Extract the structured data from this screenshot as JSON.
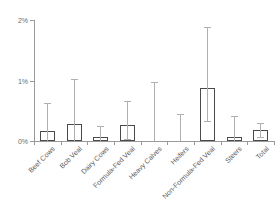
{
  "chart_data": {
    "type": "bar",
    "title": "",
    "subtitle": "",
    "xlabel": "",
    "ylabel": "",
    "ylim": [
      0,
      2
    ],
    "yunit": "%",
    "grid": false,
    "legend": false,
    "error_bars": true,
    "categories": [
      "Beef Cows",
      "Bob Veal",
      "Dairy Cows",
      "Formula-Fed Veal",
      "Heavy Calves",
      "Heifers",
      "Non-Formula-Fed Veal",
      "Steers",
      "Total"
    ],
    "values": [
      0.17,
      0.28,
      0.06,
      0.27,
      0.0,
      0.0,
      0.87,
      0.07,
      0.18
    ],
    "error_low": [
      0.0,
      0.0,
      0.0,
      0.03,
      0.0,
      0.0,
      0.33,
      0.0,
      0.07
    ],
    "error_high": [
      0.62,
      1.02,
      0.25,
      0.66,
      0.97,
      0.45,
      1.88,
      0.42,
      0.3
    ],
    "ytick_labels": [
      "0%",
      "1%",
      "2%"
    ],
    "ytick_values": [
      0,
      1,
      2
    ],
    "colors": {
      "bar_fill": "#ffffff",
      "bar_edge": "#4a4a4a",
      "error_bar": "#b0b0b0",
      "axis": "#9a9a9a",
      "tick_text": "#6d6d6d",
      "category_text": "#5a5a5a",
      "background": "#ffffff"
    }
  }
}
